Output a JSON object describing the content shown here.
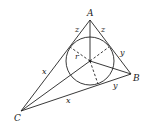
{
  "diagram": {
    "vertices": [
      {
        "id": "A",
        "label": "A",
        "x": 90,
        "y": 20
      },
      {
        "id": "B",
        "label": "B",
        "x": 131,
        "y": 74
      },
      {
        "id": "C",
        "label": "C",
        "x": 21,
        "y": 111
      }
    ],
    "incenter": {
      "x": 90,
      "y": 61,
      "radius": 24
    },
    "tangent_labels": {
      "z_left": "z",
      "z_right": "z",
      "y_upper": "y",
      "y_lower": "y",
      "x_left": "x",
      "x_lower": "x"
    },
    "radius_label": "r",
    "stroke_color": "#222222"
  }
}
